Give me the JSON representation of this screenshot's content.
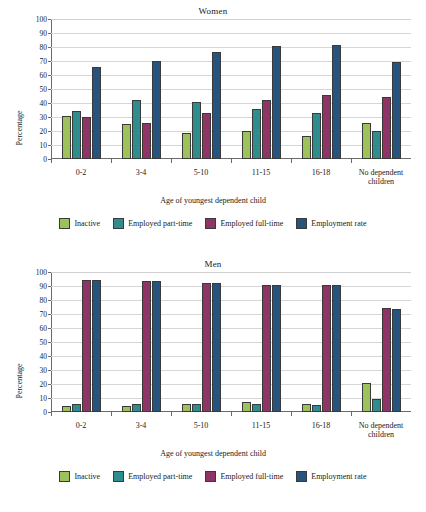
{
  "chart_data": [
    {
      "type": "bar",
      "title": "Women",
      "xlabel": "Age of youngest dependent child",
      "ylabel": "Percentage",
      "ylim": [
        0,
        100
      ],
      "ytick_step": 10,
      "yticks": [
        "100",
        "90",
        "80",
        "70",
        "60",
        "50",
        "40",
        "30",
        "20",
        "10",
        "0"
      ],
      "grid": true,
      "legend_position": "bottom",
      "categories": [
        "0-2",
        "3-4",
        "5-10",
        "11-15",
        "16-18",
        "No dependent children"
      ],
      "series": [
        {
          "name": "Inactive",
          "color": "#9dc25c",
          "values": [
            31,
            25,
            18.5,
            20,
            16.5,
            26
          ]
        },
        {
          "name": "Employed part-time",
          "color": "#2f8d8d",
          "values": [
            34,
            42,
            41,
            35.5,
            33,
            20
          ]
        },
        {
          "name": "Employed full-time",
          "color": "#8f3566",
          "values": [
            30,
            26,
            33,
            42.5,
            45.5,
            44
          ]
        },
        {
          "name": "Employment rate",
          "color": "#26547f",
          "values": [
            66,
            70,
            76.5,
            81,
            81.5,
            69
          ]
        }
      ]
    },
    {
      "type": "bar",
      "title": "Men",
      "xlabel": "Age of youngest dependent child",
      "ylabel": "Percentage",
      "ylim": [
        0,
        100
      ],
      "ytick_step": 10,
      "yticks": [
        "100",
        "90",
        "80",
        "70",
        "60",
        "50",
        "40",
        "30",
        "20",
        "10",
        "0"
      ],
      "grid": true,
      "legend_position": "bottom",
      "categories": [
        "0-2",
        "3-4",
        "5-10",
        "11-15",
        "16-18",
        "No dependent children"
      ],
      "series": [
        {
          "name": "Inactive",
          "color": "#9dc25c",
          "values": [
            4,
            4.5,
            5.5,
            7,
            5.5,
            21
          ]
        },
        {
          "name": "Employed part-time",
          "color": "#2f8d8d",
          "values": [
            5.5,
            6,
            5.5,
            6,
            5,
            9
          ]
        },
        {
          "name": "Employed full-time",
          "color": "#8f3566",
          "values": [
            94.5,
            93.5,
            92.5,
            90.5,
            91,
            74
          ]
        },
        {
          "name": "Employment rate",
          "color": "#26547f",
          "values": [
            94.5,
            93.5,
            92.5,
            90.5,
            91,
            73.5
          ]
        }
      ]
    }
  ],
  "charts": [
    {
      "title": "Women",
      "ylabel": "Percentage",
      "xlabel": "Age of youngest dependent child",
      "yticks": [
        "100",
        "90",
        "80",
        "70",
        "60",
        "50",
        "40",
        "30",
        "20",
        "10",
        "0"
      ],
      "xticks": [
        {
          "line1": "0-2",
          "line2": ""
        },
        {
          "line1": "3-4",
          "line2": ""
        },
        {
          "line1": "5-10",
          "line2": ""
        },
        {
          "line1": "11-15",
          "line2": ""
        },
        {
          "line1": "16-18",
          "line2": ""
        },
        {
          "line1": "No dependent",
          "line2": "children"
        }
      ],
      "legend": [
        {
          "label": "Inactive"
        },
        {
          "label": "Employed part-time"
        },
        {
          "label": "Employed full-time"
        },
        {
          "label": "Employment rate"
        }
      ]
    },
    {
      "title": "Men",
      "ylabel": "Percentage",
      "xlabel": "Age of youngest dependent child",
      "yticks": [
        "100",
        "90",
        "80",
        "70",
        "60",
        "50",
        "40",
        "30",
        "20",
        "10",
        "0"
      ],
      "xticks": [
        {
          "line1": "0-2",
          "line2": ""
        },
        {
          "line1": "3-4",
          "line2": ""
        },
        {
          "line1": "5-10",
          "line2": ""
        },
        {
          "line1": "11-15",
          "line2": ""
        },
        {
          "line1": "16-18",
          "line2": ""
        },
        {
          "line1": "No dependent",
          "line2": "children"
        }
      ],
      "legend": [
        {
          "label": "Inactive"
        },
        {
          "label": "Employed part-time"
        },
        {
          "label": "Employed full-time"
        },
        {
          "label": "Employment rate"
        }
      ]
    }
  ],
  "colors": {
    "inactive": "#9dc25c",
    "part_time": "#2f8d8d",
    "full_time": "#8f3566",
    "employment_rate": "#26547f",
    "gridline": "#d6d6d6",
    "axis": "#6a6a6a"
  }
}
